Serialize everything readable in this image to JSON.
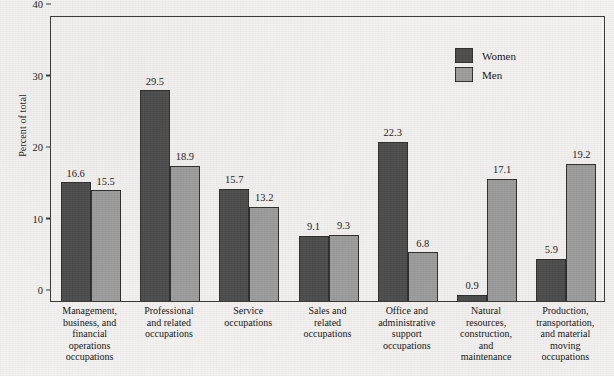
{
  "chart_data": {
    "type": "bar",
    "title": "",
    "xlabel": "",
    "ylabel": "Percent of total",
    "ylim": [
      0,
      40
    ],
    "yticks": [
      0,
      10,
      20,
      30,
      40
    ],
    "grid": false,
    "legend_position": "top-right",
    "categories": [
      "Management, business, and financial operations occupations",
      "Professional and related occupations",
      "Service occupations",
      "Sales and related occupations",
      "Office and administrative support occupations",
      "Natural resources, construction, and maintenance",
      "Production, transportation, and material moving occupations"
    ],
    "category_lines": [
      [
        "Management,",
        "business, and",
        "financial",
        "operations",
        "occupations"
      ],
      [
        "Professional",
        "and related",
        "occupations"
      ],
      [
        "Service",
        "occupations"
      ],
      [
        "Sales and",
        "related",
        "occupations"
      ],
      [
        "Office and",
        "administrative",
        "support",
        "occupations"
      ],
      [
        "Natural",
        "resources,",
        "construction,",
        "and",
        "maintenance"
      ],
      [
        "Production,",
        "transportation,",
        "and material",
        "moving",
        "occupations"
      ]
    ],
    "series": [
      {
        "name": "Women",
        "color": "#4d4d4d",
        "values": [
          16.6,
          29.5,
          15.7,
          9.1,
          22.3,
          0.9,
          5.9
        ]
      },
      {
        "name": "Men",
        "color": "#9d9d9d",
        "values": [
          15.5,
          18.9,
          13.2,
          9.3,
          6.8,
          17.1,
          19.2
        ]
      }
    ]
  },
  "axis": {
    "y_tick_labels": [
      "0",
      "10",
      "20",
      "30",
      "40"
    ]
  },
  "legend": {
    "items": [
      {
        "label": "Women",
        "color": "#4d4d4d"
      },
      {
        "label": "Men",
        "color": "#9d9d9d"
      }
    ]
  },
  "colors": {
    "background": "#f4f2f0",
    "axis": "#3a3a3a",
    "text": "#141414",
    "women": "#4d4d4d",
    "men": "#9d9d9d"
  }
}
